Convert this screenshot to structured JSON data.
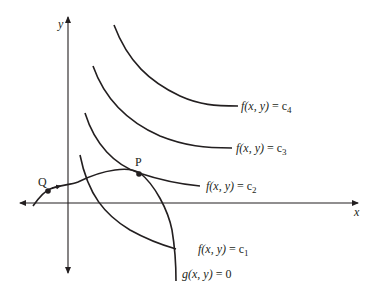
{
  "diagram": {
    "axes": {
      "x_label": "x",
      "y_label": "y"
    },
    "level_curves": [
      {
        "name": "f(x, y) = c4",
        "func": "f(x, y)",
        "eq": " = ",
        "const": "c",
        "sub": "4"
      },
      {
        "name": "f(x, y) = c3",
        "func": "f(x, y)",
        "eq": " = ",
        "const": "c",
        "sub": "3"
      },
      {
        "name": "f(x, y) = c2",
        "func": "f(x, y)",
        "eq": " = ",
        "const": "c",
        "sub": "2"
      },
      {
        "name": "f(x, y) = c1",
        "func": "f(x, y)",
        "eq": " = ",
        "const": "c",
        "sub": "1"
      }
    ],
    "constraint_curve": {
      "func": "g(x, y)",
      "eq": " = ",
      "value": "0"
    },
    "points": [
      {
        "label": "P"
      },
      {
        "label": "Q"
      }
    ],
    "colors": {
      "ink": "#231f20",
      "background": "#ffffff"
    }
  }
}
